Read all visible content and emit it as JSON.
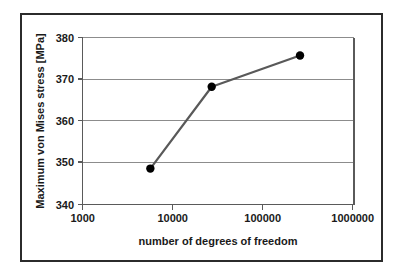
{
  "chart_data": {
    "type": "line",
    "title": "",
    "xlabel": "number of degrees of freedom",
    "ylabel": "Maximum von Mises stress [MPa]",
    "xscale": "log",
    "yscale": "linear",
    "xlim": [
      1000,
      1000000
    ],
    "ylim": [
      340,
      380
    ],
    "xticks": [
      1000,
      10000,
      100000,
      1000000
    ],
    "xtick_labels": [
      "1000",
      "10000",
      "100000",
      "1000000"
    ],
    "yticks": [
      340,
      350,
      360,
      370,
      380
    ],
    "ytick_labels": [
      "340",
      "350",
      "360",
      "370",
      "380"
    ],
    "grid": {
      "horizontal": true,
      "vertical": false,
      "color": "#8c8c8c"
    },
    "legend": {
      "visible": false,
      "position": "none"
    },
    "series": [
      {
        "name": "Maximum von Mises stress",
        "line_color": "#595959",
        "marker_color": "#000000",
        "marker": "circle",
        "x": [
          5600,
          26700,
          253000
        ],
        "y": [
          348.6,
          368.2,
          375.7
        ],
        "points": [
          {
            "x": 5600,
            "y": 348.6
          },
          {
            "x": 26700,
            "y": 368.2
          },
          {
            "x": 253000,
            "y": 375.7
          }
        ]
      }
    ],
    "annotations": []
  },
  "figure": {
    "border_color": "#2b2b2b",
    "background": "#ffffff",
    "axis_color": "#5a5a5a"
  }
}
